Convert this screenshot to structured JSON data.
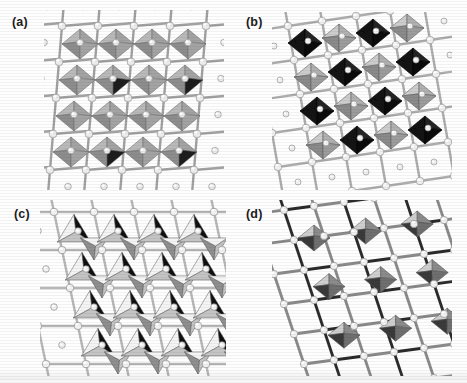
{
  "figure": {
    "type": "scientific-figure",
    "background_color": "#fefefe",
    "panel_count": 4,
    "grid": "2x2"
  },
  "panels": [
    {
      "id": "a",
      "label": "(a)",
      "label_x": 12,
      "label_y": 16,
      "stage_x": 44,
      "stage_y": 10,
      "stage_w": 180,
      "stage_h": 180,
      "structure": "corner-sharing-octahedra-framework",
      "polyhedron": "octahedron",
      "polyhedron_fill_top": "#b9b9b9",
      "polyhedron_fill_left": "#8d8d8d",
      "polyhedron_fill_right": "#a3a3a3",
      "polyhedron_fill_dark": "#1d1d1d",
      "sphere_color": "#ececec",
      "sphere_shade": "#9a9a9a",
      "bond_color": "#9d9d9d",
      "edge_color": "#6f6f6f",
      "rows": 4,
      "cols": 4,
      "description": "dense grid of pale grey octahedra sharing corners, surrounded by white spheres on grey bonds"
    },
    {
      "id": "b",
      "label": "(b)",
      "label_x": 246,
      "label_y": 16,
      "stage_x": 272,
      "stage_y": 12,
      "stage_w": 180,
      "stage_h": 178,
      "structure": "ordered-black-grey-octahedra-checkerboard",
      "polyhedron": "octahedron",
      "polyhedron_fill_top": "#cccccc",
      "polyhedron_fill_left": "#8a8a8a",
      "polyhedron_fill_right": "#b0b0b0",
      "polyhedron_fill_dark": "#141414",
      "sphere_color": "#f0f0f0",
      "sphere_shade": "#9a9a9a",
      "bond_color": "#a5a5a5",
      "edge_color": "#5e5e5e",
      "rows": 4,
      "cols": 4,
      "description": "alternating black and light grey octahedra in checkerboard cation ordering within a dense ball and stick net"
    },
    {
      "id": "c",
      "label": "(c)",
      "label_x": 14,
      "label_y": 208,
      "stage_x": 40,
      "stage_y": 200,
      "stage_w": 186,
      "stage_h": 176,
      "structure": "edge-sharing-tetrahedra-array",
      "polyhedron": "tetrahedron",
      "polyhedron_fill_top": "#f4f4f4",
      "polyhedron_fill_left": "#8f8f8f",
      "polyhedron_fill_right": "#c4c4c4",
      "polyhedron_fill_dark": "#101010",
      "sphere_color": "#f2f2f2",
      "sphere_shade": "#8f8f8f",
      "bond_color": "#b0b0b0",
      "edge_color": "#565656",
      "rows": 4,
      "cols": 4,
      "description": "array of tetrahedra with strongly contrasting white black and grey faces linked by pale bonds"
    },
    {
      "id": "d",
      "label": "(d)",
      "label_x": 246,
      "label_y": 208,
      "stage_x": 272,
      "stage_y": 200,
      "stage_w": 180,
      "stage_h": 176,
      "structure": "isolated-octahedra-in-open-framework",
      "polyhedron": "octahedron",
      "polyhedron_fill_top": "#cfcfcf",
      "polyhedron_fill_left": "#8b8b8b",
      "polyhedron_fill_right": "#6f6f6f",
      "polyhedron_fill_dark": "#3a3a3a",
      "sphere_color": "#f1f1f1",
      "sphere_shade": "#939393",
      "bond_color": "#8a8a8a",
      "bond_dark_color": "#2b2b2b",
      "edge_color": "#5a5a5a",
      "rows": 3,
      "cols": 3,
      "description": "sparse grey octahedra arranged in diagonal rows inside an open dark bonded network"
    }
  ],
  "render": {
    "octa_half_w": 15,
    "octa_half_h": 11,
    "tetra_w": 26,
    "tetra_h": 24,
    "sphere_r": 3.3,
    "bond_w": 2.4
  }
}
